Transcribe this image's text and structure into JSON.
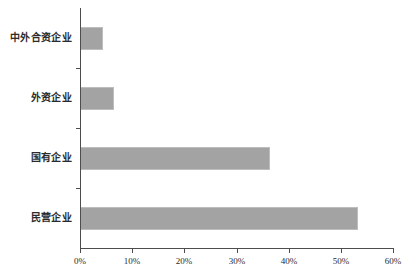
{
  "chart_data": {
    "type": "bar",
    "orientation": "horizontal",
    "title": "",
    "subtitle": "",
    "xlabel": "",
    "ylabel": "",
    "categories": [
      "民营企业",
      "国有企业",
      "外资企业",
      "中外合资企业"
    ],
    "values": [
      53.3,
      36.4,
      6.5,
      4.4
    ],
    "value_suffix": "%",
    "xlim": [
      0,
      60
    ],
    "xticks": [
      0,
      10,
      20,
      30,
      40,
      50,
      60
    ],
    "xtick_labels": [
      "0%",
      "10%",
      "20%",
      "30%",
      "40%",
      "50%",
      "60%"
    ],
    "grid": false,
    "legend": false,
    "legend_position": "none",
    "bar_color": "#a3a3a3",
    "bar_border_color": "#bdbdbd",
    "axis_color": "#4d4d4d",
    "background_color": "#ffffff",
    "series": [
      {
        "name": "",
        "values": [
          53.3,
          36.4,
          6.5,
          4.4
        ]
      }
    ],
    "points": [
      {
        "category": "民营企业",
        "value": 53.3
      },
      {
        "category": "国有企业",
        "value": 36.4
      },
      {
        "category": "外资企业",
        "value": 6.5
      },
      {
        "category": "中外合资企业",
        "value": 4.4
      }
    ]
  }
}
